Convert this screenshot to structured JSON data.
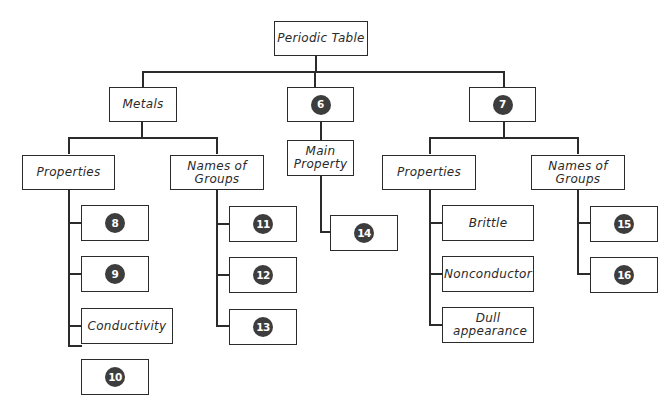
{
  "diagram": {
    "type": "tree",
    "root": "Periodic Table",
    "level1": {
      "metals": "Metals",
      "middle": "6",
      "right": "7"
    },
    "metals_branch": {
      "properties": "Properties",
      "names_of_groups": "Names of Groups",
      "properties_items": [
        "8",
        "9",
        "Conductivity",
        "10"
      ],
      "group_items": [
        "11",
        "12",
        "13"
      ]
    },
    "middle_branch": {
      "main_property": "Main Property",
      "items": [
        "14"
      ]
    },
    "right_branch": {
      "properties": "Properties",
      "names_of_groups": "Names of Groups",
      "properties_items": [
        "Brittle",
        "Nonconductor",
        "Dull appearance"
      ],
      "group_items": [
        "15",
        "16"
      ]
    }
  },
  "colors": {
    "line": "#2b2b2b",
    "badge": "#3d3d3d",
    "badge_text": "#ffffff"
  }
}
